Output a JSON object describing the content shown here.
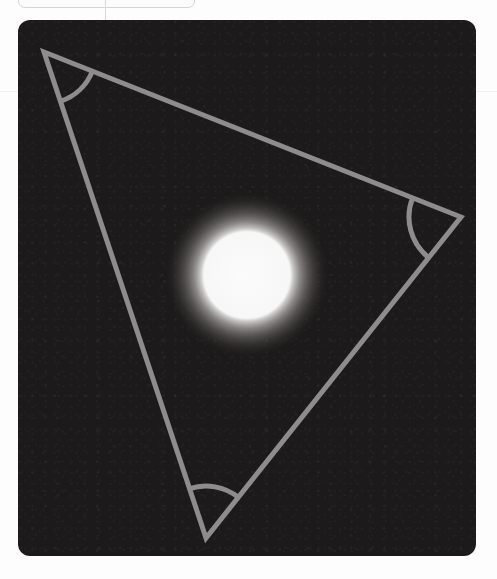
{
  "page": {
    "background_color": "#fdfdfd",
    "width": 497,
    "height": 579
  },
  "top_node": {
    "label": "",
    "border_color": "#d2d4d7",
    "fill_color": "#fbfbfc",
    "cropped": "true"
  },
  "panel": {
    "name": "geometry-canvas",
    "background_color": "#1c1a1a",
    "corner_radius": 12,
    "left": 18,
    "top": 20,
    "width": 458,
    "height": 536
  },
  "figure": {
    "type": "triangle-with-angle-arcs-and-glow",
    "stroke_color": "#8d8d8d",
    "stroke_width": 5,
    "vertices": [
      {
        "name": "vertex-top-left",
        "x": 44,
        "y": 52
      },
      {
        "name": "vertex-right",
        "x": 461,
        "y": 217
      },
      {
        "name": "vertex-bottom",
        "x": 206,
        "y": 538
      }
    ],
    "angle_arcs": [
      {
        "name": "angle-arc-top-left",
        "at_vertex": "vertex-top-left",
        "radius": 52
      },
      {
        "name": "angle-arc-right",
        "at_vertex": "vertex-right",
        "radius": 52
      },
      {
        "name": "angle-arc-bottom",
        "at_vertex": "vertex-bottom",
        "radius": 52
      }
    ],
    "glow": {
      "name": "glowing-circle",
      "center_x": 247,
      "center_y": 275,
      "core_radius": 45,
      "glow_radius": 83,
      "core_color": "#f9f9f9",
      "halo_color": "#6e6c6b"
    }
  }
}
